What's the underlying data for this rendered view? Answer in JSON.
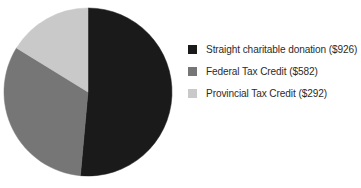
{
  "chart_data": {
    "type": "pie",
    "title": "",
    "subtitle": "",
    "xlabel": "",
    "ylabel": "",
    "grid": false,
    "legend_position": "right",
    "start_angle_deg": 0,
    "direction": "clockwise",
    "total": 1800,
    "currency": "$",
    "categories": [
      "Straight charitable donation",
      "Federal Tax Credit",
      "Provincial Tax Credit"
    ],
    "values": [
      926,
      582,
      292
    ],
    "slices": [
      {
        "label": "Straight charitable donation ($926)",
        "name": "Straight charitable donation",
        "value": 926,
        "value_text": "$926",
        "percent": 51.4,
        "angle_deg": 185.2,
        "color": "#1a1a1a"
      },
      {
        "label": "Federal Tax Credit ($582)",
        "name": "Federal Tax Credit",
        "value": 582,
        "value_text": "$582",
        "percent": 32.3,
        "angle_deg": 116.4,
        "color": "#767676"
      },
      {
        "label": "Provincial Tax Credit ($292)",
        "name": "Provincial Tax Credit",
        "value": 292,
        "value_text": "$292",
        "percent": 16.2,
        "angle_deg": 58.4,
        "color": "#c9c9c9"
      }
    ],
    "geometry": {
      "center_x": 88,
      "center_y": 92,
      "radius": 84
    },
    "colors": {
      "background": "#ffffff",
      "text": "#2b2b2b",
      "slice_1": "#1a1a1a",
      "slice_2": "#767676",
      "slice_3": "#c9c9c9"
    }
  },
  "legend": {
    "items": [
      {
        "label": "Straight charitable donation ($926)",
        "color": "#1a1a1a"
      },
      {
        "label": "Federal Tax Credit ($582)",
        "color": "#767676"
      },
      {
        "label": "Provincial Tax Credit ($292)",
        "color": "#c9c9c9"
      }
    ]
  }
}
